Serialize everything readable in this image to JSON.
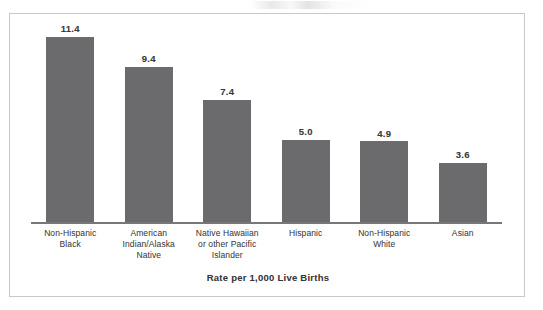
{
  "figure": {
    "frame_border_color": "#c8c8cc",
    "background_color": "#ffffff",
    "bar_color": "#6b6b6d",
    "axis_color": "#777779",
    "text_color": "#3a3a3c"
  },
  "chart_data": {
    "type": "bar",
    "title": "",
    "subtitle": "",
    "xlabel": "Rate per 1,000 Live Births",
    "ylabel": "",
    "ylim": [
      0,
      12
    ],
    "grid": false,
    "legend": null,
    "categories": [
      "Non-Hispanic Black",
      "American Indian/Alaska Native",
      "Native Hawaiian or other Pacific Islander",
      "Hispanic",
      "Non-Hispanic White",
      "Asian"
    ],
    "category_lines": [
      [
        "Non-Hispanic",
        "Black"
      ],
      [
        "American",
        "Indian/Alaska",
        "Native"
      ],
      [
        "Native Hawaiian",
        "or other Pacific",
        "Islander"
      ],
      [
        "Hispanic"
      ],
      [
        "Non-Hispanic",
        "White"
      ],
      [
        "Asian"
      ]
    ],
    "values": [
      11.4,
      9.4,
      7.4,
      5.0,
      4.9,
      3.6
    ],
    "value_labels": [
      "11.4",
      "9.4",
      "7.4",
      "5.0",
      "4.9",
      "3.6"
    ]
  }
}
